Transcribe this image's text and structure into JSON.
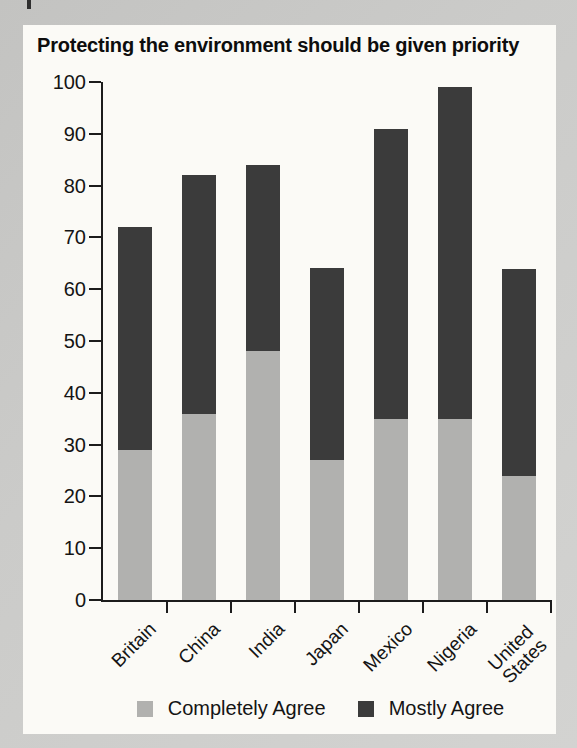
{
  "figure": {
    "panel_background": "#fbfaf6",
    "page_background": "#cbcbc9",
    "axis_color": "#1c1c1c",
    "text_color": "#141414"
  },
  "chart_data": {
    "type": "bar",
    "stacked": true,
    "title": "Protecting the environment should be given priority",
    "categories": [
      "Britain",
      "China",
      "India",
      "Japan",
      "Mexico",
      "Nigeria",
      "United States"
    ],
    "series": [
      {
        "name": "Completely Agree",
        "color": "#b1b1af",
        "values": [
          29,
          36,
          48,
          27,
          35,
          35,
          24
        ]
      },
      {
        "name": "Mostly Agree",
        "color": "#3b3b3b",
        "values": [
          43,
          46,
          36,
          37,
          56,
          64,
          40
        ]
      }
    ],
    "totals": [
      72,
      82,
      84,
      64,
      91,
      99,
      64
    ],
    "xlabel": "",
    "ylabel": "",
    "ylim": [
      0,
      100
    ],
    "yticks": [
      0,
      10,
      20,
      30,
      40,
      50,
      60,
      70,
      80,
      90,
      100
    ],
    "grid": false,
    "legend_position": "bottom",
    "x_tick_placement": "between-categories",
    "x_label_rotation_deg": -45
  }
}
